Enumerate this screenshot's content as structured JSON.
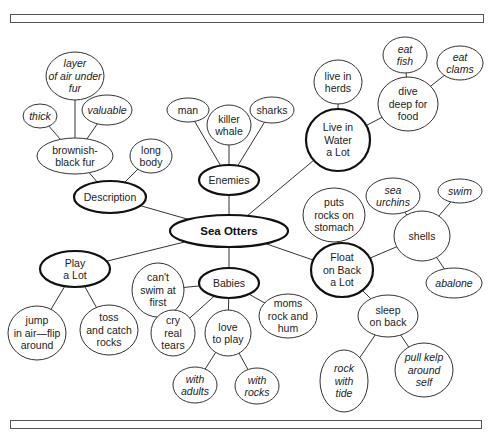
{
  "diagram": {
    "title": "Sea Otters",
    "nodes": [
      {
        "id": "sea-otters",
        "label": [
          "Sea Otters"
        ],
        "style": "center"
      },
      {
        "id": "description",
        "label": [
          "Description"
        ],
        "style": "major"
      },
      {
        "id": "enemies",
        "label": [
          "Enemies"
        ],
        "style": "major"
      },
      {
        "id": "live-in-water",
        "label": [
          "Live in",
          "Water",
          "a Lot"
        ],
        "style": "major"
      },
      {
        "id": "play-a-lot",
        "label": [
          "Play",
          "a Lot"
        ],
        "style": "major"
      },
      {
        "id": "babies",
        "label": [
          "Babies"
        ],
        "style": "major"
      },
      {
        "id": "float-on-back",
        "label": [
          "Float",
          "on Back",
          "a Lot"
        ],
        "style": "major"
      },
      {
        "id": "brownish-black-fur",
        "label": [
          "brownish-",
          "black fur"
        ],
        "style": "minor"
      },
      {
        "id": "thick",
        "label": [
          "thick"
        ],
        "style": "italic"
      },
      {
        "id": "layer-of-air",
        "label": [
          "layer",
          "of air under",
          "fur"
        ],
        "style": "italic"
      },
      {
        "id": "valuable",
        "label": [
          "valuable"
        ],
        "style": "italic"
      },
      {
        "id": "long-body",
        "label": [
          "long",
          "body"
        ],
        "style": "minor"
      },
      {
        "id": "man",
        "label": [
          "man"
        ],
        "style": "minor"
      },
      {
        "id": "killer-whale",
        "label": [
          "killer",
          "whale"
        ],
        "style": "minor"
      },
      {
        "id": "sharks",
        "label": [
          "sharks"
        ],
        "style": "minor"
      },
      {
        "id": "live-in-herds",
        "label": [
          "live in",
          "herds"
        ],
        "style": "minor"
      },
      {
        "id": "dive-deep",
        "label": [
          "dive",
          "deep for",
          "food"
        ],
        "style": "minor"
      },
      {
        "id": "eat-fish",
        "label": [
          "eat",
          "fish"
        ],
        "style": "italic"
      },
      {
        "id": "eat-clams",
        "label": [
          "eat",
          "clams"
        ],
        "style": "italic"
      },
      {
        "id": "puts-rocks",
        "label": [
          "puts",
          "rocks on",
          "stomach"
        ],
        "style": "minor"
      },
      {
        "id": "sea-urchins",
        "label": [
          "sea",
          "urchins"
        ],
        "style": "italic"
      },
      {
        "id": "swim",
        "label": [
          "swim"
        ],
        "style": "italic"
      },
      {
        "id": "shells",
        "label": [
          "shells"
        ],
        "style": "minor"
      },
      {
        "id": "abalone",
        "label": [
          "abalone"
        ],
        "style": "italic"
      },
      {
        "id": "sleep-on-back",
        "label": [
          "sleep",
          "on back"
        ],
        "style": "minor"
      },
      {
        "id": "rock-with-tide",
        "label": [
          "rock",
          "with",
          "tide"
        ],
        "style": "italic"
      },
      {
        "id": "pull-kelp",
        "label": [
          "pull kelp",
          "around",
          "self"
        ],
        "style": "italic"
      },
      {
        "id": "cant-swim",
        "label": [
          "can't",
          "swim at",
          "first"
        ],
        "style": "minor"
      },
      {
        "id": "cry-real-tears",
        "label": [
          "cry",
          "real",
          "tears"
        ],
        "style": "minor"
      },
      {
        "id": "love-to-play",
        "label": [
          "love",
          "to play"
        ],
        "style": "minor"
      },
      {
        "id": "moms-rock",
        "label": [
          "moms",
          "rock and",
          "hum"
        ],
        "style": "minor"
      },
      {
        "id": "jump-in-air",
        "label": [
          "jump",
          "in air—flip",
          "around"
        ],
        "style": "minor"
      },
      {
        "id": "toss-and-catch",
        "label": [
          "toss",
          "and catch",
          "rocks"
        ],
        "style": "minor"
      },
      {
        "id": "with-adults",
        "label": [
          "with",
          "adults"
        ],
        "style": "italic"
      },
      {
        "id": "with-rocks",
        "label": [
          "with",
          "rocks"
        ],
        "style": "italic"
      }
    ],
    "edges": [
      [
        "sea-otters",
        "description"
      ],
      [
        "sea-otters",
        "enemies"
      ],
      [
        "sea-otters",
        "live-in-water"
      ],
      [
        "sea-otters",
        "play-a-lot"
      ],
      [
        "sea-otters",
        "babies"
      ],
      [
        "sea-otters",
        "float-on-back"
      ],
      [
        "description",
        "brownish-black-fur"
      ],
      [
        "description",
        "long-body"
      ],
      [
        "brownish-black-fur",
        "thick"
      ],
      [
        "brownish-black-fur",
        "layer-of-air"
      ],
      [
        "brownish-black-fur",
        "valuable"
      ],
      [
        "enemies",
        "man"
      ],
      [
        "enemies",
        "killer-whale"
      ],
      [
        "enemies",
        "sharks"
      ],
      [
        "live-in-water",
        "live-in-herds"
      ],
      [
        "live-in-water",
        "dive-deep"
      ],
      [
        "dive-deep",
        "eat-fish"
      ],
      [
        "dive-deep",
        "eat-clams"
      ],
      [
        "float-on-back",
        "puts-rocks"
      ],
      [
        "float-on-back",
        "shells"
      ],
      [
        "float-on-back",
        "sleep-on-back"
      ],
      [
        "shells",
        "sea-urchins"
      ],
      [
        "shells",
        "swim"
      ],
      [
        "shells",
        "abalone"
      ],
      [
        "sleep-on-back",
        "rock-with-tide"
      ],
      [
        "sleep-on-back",
        "pull-kelp"
      ],
      [
        "babies",
        "cant-swim"
      ],
      [
        "babies",
        "cry-real-tears"
      ],
      [
        "babies",
        "love-to-play"
      ],
      [
        "babies",
        "moms-rock"
      ],
      [
        "love-to-play",
        "with-adults"
      ],
      [
        "love-to-play",
        "with-rocks"
      ],
      [
        "play-a-lot",
        "jump-in-air"
      ],
      [
        "play-a-lot",
        "toss-and-catch"
      ]
    ]
  }
}
